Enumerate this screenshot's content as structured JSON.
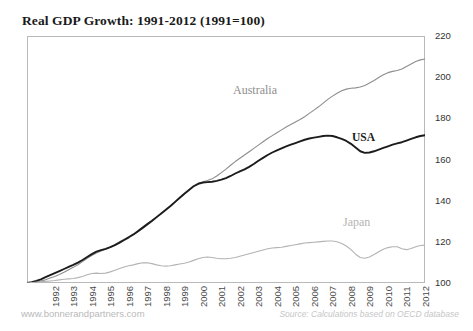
{
  "chart_data": {
    "type": "line",
    "title": "Real GDP Growth: 1991-2012 (1991=100)",
    "xlabel": "",
    "ylabel": "",
    "ylim": [
      100,
      220
    ],
    "yticks": [
      100,
      120,
      140,
      160,
      180,
      200,
      220
    ],
    "xlim": [
      1991,
      2012.5
    ],
    "xticks": [
      1992,
      1993,
      1994,
      1995,
      1996,
      1997,
      1998,
      1999,
      2000,
      2001,
      2002,
      2003,
      2004,
      2005,
      2006,
      2007,
      2008,
      2009,
      2010,
      2011,
      2012
    ],
    "grid": false,
    "legend_position": "inline-annotations",
    "x": [
      1991,
      1991.25,
      1991.5,
      1991.75,
      1992,
      1992.25,
      1992.5,
      1992.75,
      1993,
      1993.25,
      1993.5,
      1993.75,
      1994,
      1994.25,
      1994.5,
      1994.75,
      1995,
      1995.25,
      1995.5,
      1995.75,
      1996,
      1996.25,
      1996.5,
      1996.75,
      1997,
      1997.25,
      1997.5,
      1997.75,
      1998,
      1998.25,
      1998.5,
      1998.75,
      1999,
      1999.25,
      1999.5,
      1999.75,
      2000,
      2000.25,
      2000.5,
      2000.75,
      2001,
      2001.25,
      2001.5,
      2001.75,
      2002,
      2002.25,
      2002.5,
      2002.75,
      2003,
      2003.25,
      2003.5,
      2003.75,
      2004,
      2004.25,
      2004.5,
      2004.75,
      2005,
      2005.25,
      2005.5,
      2005.75,
      2006,
      2006.25,
      2006.5,
      2006.75,
      2007,
      2007.25,
      2007.5,
      2007.75,
      2008,
      2008.25,
      2008.5,
      2008.75,
      2009,
      2009.25,
      2009.5,
      2009.75,
      2010,
      2010.25,
      2010.5,
      2010.75,
      2011,
      2011.25,
      2011.5,
      2011.75,
      2012,
      2012.25,
      2012.5
    ],
    "series": [
      {
        "name": "Australia",
        "color": "#8d8d8d",
        "values": [
          100.0,
          100.2,
          100.5,
          100.9,
          101.6,
          102.4,
          103.2,
          104.1,
          105.2,
          106.4,
          107.6,
          108.9,
          110.4,
          112.0,
          113.4,
          114.6,
          115.6,
          116.4,
          117.4,
          118.6,
          120.0,
          121.3,
          122.5,
          123.6,
          125.0,
          126.5,
          128.2,
          129.9,
          131.8,
          133.8,
          135.6,
          137.3,
          139.2,
          141.2,
          143.2,
          145.1,
          147.0,
          148.4,
          149.2,
          149.8,
          150.6,
          152.0,
          153.6,
          155.3,
          157.2,
          159.0,
          160.6,
          162.2,
          163.8,
          165.4,
          167.0,
          168.6,
          170.2,
          171.6,
          173.0,
          174.4,
          175.8,
          177.0,
          178.2,
          179.4,
          180.8,
          182.4,
          184.0,
          185.6,
          187.4,
          189.2,
          190.8,
          192.2,
          193.4,
          194.2,
          194.6,
          194.8,
          195.2,
          196.0,
          197.2,
          198.4,
          199.8,
          201.2,
          202.2,
          202.8,
          203.2,
          204.0,
          205.2,
          206.4,
          207.6,
          208.4,
          208.8
        ]
      },
      {
        "name": "USA",
        "color": "#1c1c1c",
        "values": [
          100.0,
          100.4,
          101.0,
          101.8,
          102.8,
          103.8,
          104.8,
          105.8,
          106.8,
          107.8,
          108.8,
          109.9,
          111.2,
          112.6,
          114.0,
          115.2,
          116.0,
          116.6,
          117.4,
          118.4,
          119.6,
          120.9,
          122.2,
          123.6,
          125.2,
          126.9,
          128.6,
          130.2,
          132.0,
          133.8,
          135.6,
          137.4,
          139.4,
          141.4,
          143.4,
          145.2,
          147.0,
          148.2,
          148.8,
          149.0,
          149.2,
          149.6,
          150.2,
          151.0,
          152.0,
          153.2,
          154.2,
          155.2,
          156.4,
          157.8,
          159.4,
          160.8,
          162.2,
          163.4,
          164.4,
          165.4,
          166.4,
          167.2,
          168.0,
          168.8,
          169.6,
          170.2,
          170.6,
          171.0,
          171.4,
          171.6,
          171.4,
          170.8,
          170.0,
          169.0,
          167.6,
          165.8,
          164.0,
          163.2,
          163.4,
          164.0,
          164.8,
          165.6,
          166.4,
          167.2,
          167.8,
          168.4,
          169.2,
          170.0,
          170.8,
          171.4,
          171.8
        ]
      },
      {
        "name": "Japan",
        "color": "#b3b3b3",
        "values": [
          100.0,
          100.2,
          100.4,
          100.6,
          100.8,
          101.0,
          101.2,
          101.5,
          101.8,
          102.0,
          102.2,
          102.6,
          103.2,
          104.0,
          104.6,
          104.8,
          104.6,
          104.8,
          105.4,
          106.2,
          107.0,
          107.8,
          108.4,
          108.8,
          109.4,
          109.8,
          109.8,
          109.4,
          108.8,
          108.4,
          108.2,
          108.4,
          108.8,
          109.2,
          109.6,
          110.2,
          111.0,
          111.8,
          112.4,
          112.6,
          112.4,
          112.0,
          111.8,
          111.8,
          112.0,
          112.4,
          113.0,
          113.6,
          114.2,
          114.8,
          115.4,
          116.0,
          116.6,
          117.0,
          117.2,
          117.4,
          117.8,
          118.2,
          118.6,
          119.0,
          119.4,
          119.6,
          119.8,
          120.0,
          120.2,
          120.4,
          120.4,
          120.0,
          119.2,
          118.0,
          116.2,
          114.0,
          112.4,
          112.0,
          112.6,
          113.8,
          115.2,
          116.4,
          117.2,
          117.6,
          117.6,
          116.6,
          116.2,
          116.8,
          117.6,
          118.2,
          118.4
        ]
      }
    ],
    "annotations": [
      {
        "text": "Australia",
        "series": "Australia"
      },
      {
        "text": "USA",
        "series": "USA"
      },
      {
        "text": "Japan",
        "series": "Japan"
      }
    ]
  },
  "footer": {
    "website": "www.bonnerandpartners.com",
    "source": "Source: Calculations based on OECD database"
  }
}
